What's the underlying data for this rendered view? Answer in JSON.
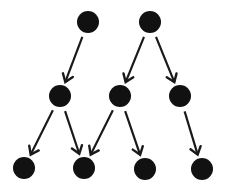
{
  "diagram": {
    "type": "directed-graph",
    "node_color": "#111111",
    "edge_color": "#1a1a1a",
    "node_radius": 11,
    "nodes": [
      {
        "id": "n1",
        "x": 88,
        "y": 22
      },
      {
        "id": "n2",
        "x": 150,
        "y": 22
      },
      {
        "id": "n3",
        "x": 60,
        "y": 96
      },
      {
        "id": "n4",
        "x": 120,
        "y": 96
      },
      {
        "id": "n5",
        "x": 180,
        "y": 96
      },
      {
        "id": "n6",
        "x": 24,
        "y": 168
      },
      {
        "id": "n7",
        "x": 84,
        "y": 168
      },
      {
        "id": "n8",
        "x": 145,
        "y": 169
      },
      {
        "id": "n9",
        "x": 202,
        "y": 169
      }
    ],
    "edges": [
      {
        "from": "n1",
        "to": "n3"
      },
      {
        "from": "n2",
        "to": "n4"
      },
      {
        "from": "n2",
        "to": "n5"
      },
      {
        "from": "n3",
        "to": "n6"
      },
      {
        "from": "n3",
        "to": "n7"
      },
      {
        "from": "n4",
        "to": "n7"
      },
      {
        "from": "n4",
        "to": "n8"
      },
      {
        "from": "n5",
        "to": "n9"
      }
    ]
  }
}
